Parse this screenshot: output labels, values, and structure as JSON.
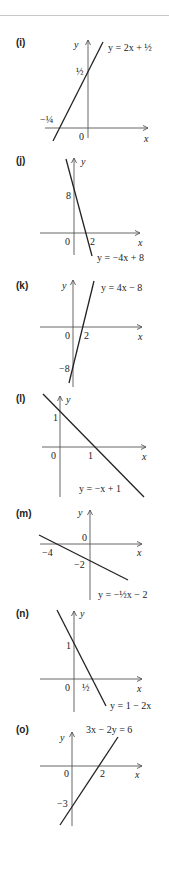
{
  "chart_data": [
    {
      "type": "line",
      "label": "(i)",
      "equation": "y = 2x + ½",
      "slope": 2,
      "intercept": 0.5,
      "x_intercept_label": "−¼",
      "y_intercept_label": "½",
      "origin_label": "0",
      "xlabel": "x",
      "ylabel": "y",
      "axes": {
        "ox": 88,
        "oy": 128,
        "ytop": 40,
        "ybottom": 138,
        "xleft": 45,
        "xright": 148
      },
      "segment": [
        [
          53,
          141
        ],
        [
          103,
          42
        ]
      ],
      "ticks": [
        {
          "text": "½",
          "x": 76,
          "y": 75
        },
        {
          "text": "−¼",
          "x": 40,
          "y": 123
        },
        {
          "text": "0",
          "x": 79,
          "y": 140
        }
      ],
      "eq_pos": [
        108,
        51
      ],
      "ylabel_pos": [
        74,
        48
      ],
      "xlabel_pos": [
        144,
        142
      ],
      "label_pos": [
        16,
        46
      ]
    },
    {
      "type": "line",
      "label": "(j)",
      "equation": "y = −4x + 8",
      "slope": -4,
      "intercept": 8,
      "x_intercept_label": "2",
      "y_intercept_label": "8",
      "origin_label": "0",
      "xlabel": "x",
      "ylabel": "y",
      "axes": {
        "ox": 74,
        "oy": 233,
        "ytop": 158,
        "ybottom": 255,
        "xleft": 40,
        "xright": 140
      },
      "segment": [
        [
          66,
          159
        ],
        [
          92,
          256
        ]
      ],
      "ticks": [
        {
          "text": "8",
          "x": 66,
          "y": 199
        },
        {
          "text": "2",
          "x": 90,
          "y": 245
        },
        {
          "text": "0",
          "x": 65,
          "y": 245
        }
      ],
      "eq_pos": [
        97,
        261
      ],
      "ylabel_pos": [
        81,
        165
      ],
      "xlabel_pos": [
        138,
        246
      ],
      "label_pos": [
        16,
        164
      ]
    },
    {
      "type": "line",
      "label": "(k)",
      "equation": "y = 4x − 8",
      "slope": 4,
      "intercept": -8,
      "x_intercept_label": "2",
      "y_intercept_label": "−8",
      "origin_label": "0",
      "xlabel": "x",
      "ylabel": "y",
      "axes": {
        "ox": 73,
        "oy": 327,
        "ytop": 280,
        "ybottom": 387,
        "xleft": 40,
        "xright": 142
      },
      "segment": [
        [
          69,
          383
        ],
        [
          94,
          281
        ]
      ],
      "ticks": [
        {
          "text": "2",
          "x": 84,
          "y": 339
        },
        {
          "text": "0",
          "x": 65,
          "y": 339
        },
        {
          "text": "−8",
          "x": 59,
          "y": 372
        }
      ],
      "eq_pos": [
        101,
        291
      ],
      "ylabel_pos": [
        62,
        289
      ],
      "xlabel_pos": [
        138,
        340
      ],
      "label_pos": [
        16,
        289
      ]
    },
    {
      "type": "line",
      "label": "(l)",
      "equation": "y = −x + 1",
      "slope": -1,
      "intercept": 1,
      "x_intercept_label": "1",
      "y_intercept_label": "1",
      "origin_label": "0",
      "xlabel": "x",
      "ylabel": "y",
      "axes": {
        "ox": 60,
        "oy": 447,
        "ytop": 396,
        "ybottom": 497,
        "xleft": 42,
        "xright": 146
      },
      "segment": [
        [
          43,
          394
        ],
        [
          144,
          497
        ]
      ],
      "ticks": [
        {
          "text": "1",
          "x": 53,
          "y": 421
        },
        {
          "text": "1",
          "x": 88,
          "y": 459
        },
        {
          "text": "0",
          "x": 51,
          "y": 459
        }
      ],
      "eq_pos": [
        79,
        492
      ],
      "ylabel_pos": [
        66,
        403
      ],
      "xlabel_pos": [
        142,
        460
      ],
      "label_pos": [
        16,
        402
      ]
    },
    {
      "type": "line",
      "label": "(m)",
      "equation": "y = −½x − 2",
      "slope": -0.5,
      "intercept": -2,
      "x_intercept_label": "−4",
      "y_intercept_label": "−2",
      "origin_label": "0",
      "xlabel": "x",
      "ylabel": "y",
      "axes": {
        "ox": 90,
        "oy": 544,
        "ytop": 510,
        "ybottom": 600,
        "xleft": 40,
        "xright": 142
      },
      "segment": [
        [
          39,
          535
        ],
        [
          128,
          580
        ]
      ],
      "ticks": [
        {
          "text": "0",
          "x": 82,
          "y": 541
        },
        {
          "text": "−4",
          "x": 42,
          "y": 556
        },
        {
          "text": "−2",
          "x": 74,
          "y": 568
        }
      ],
      "eq_pos": [
        98,
        598
      ],
      "ylabel_pos": [
        78,
        516
      ],
      "xlabel_pos": [
        137,
        556
      ],
      "label_pos": [
        16,
        517
      ]
    },
    {
      "type": "line",
      "label": "(n)",
      "equation": "y = 1 − 2x",
      "slope": -2,
      "intercept": 1,
      "x_intercept_label": "½",
      "y_intercept_label": "1",
      "origin_label": "0",
      "xlabel": "x",
      "ylabel": "y",
      "axes": {
        "ox": 74,
        "oy": 679,
        "ytop": 611,
        "ybottom": 712,
        "xleft": 40,
        "xright": 142
      },
      "segment": [
        [
          57,
          610
        ],
        [
          106,
          706
        ]
      ],
      "ticks": [
        {
          "text": "1",
          "x": 66,
          "y": 649
        },
        {
          "text": "½",
          "x": 82,
          "y": 691
        },
        {
          "text": "0",
          "x": 65,
          "y": 691
        }
      ],
      "eq_pos": [
        110,
        709
      ],
      "ylabel_pos": [
        80,
        617
      ],
      "xlabel_pos": [
        137,
        692
      ],
      "label_pos": [
        16,
        617
      ]
    },
    {
      "type": "line",
      "label": "(o)",
      "equation": "3x − 2y = 6",
      "slope": 1.5,
      "intercept": -3,
      "x_intercept_label": "2",
      "y_intercept_label": "−3",
      "origin_label": "0",
      "xlabel": "x",
      "ylabel": "y",
      "axes": {
        "ox": 72,
        "oy": 766,
        "ytop": 732,
        "ybottom": 826,
        "xleft": 40,
        "xright": 142
      },
      "segment": [
        [
          60,
          825
        ],
        [
          118,
          737
        ]
      ],
      "ticks": [
        {
          "text": "0",
          "x": 64,
          "y": 777
        },
        {
          "text": "2",
          "x": 100,
          "y": 777
        },
        {
          "text": "−3",
          "x": 57,
          "y": 807
        }
      ],
      "eq_pos": [
        86,
        733
      ],
      "ylabel_pos": [
        60,
        741
      ],
      "xlabel_pos": [
        135,
        778
      ],
      "label_pos": [
        16,
        733
      ]
    }
  ]
}
